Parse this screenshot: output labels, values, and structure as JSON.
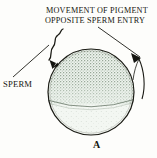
{
  "figure": {
    "panel_letter": "A",
    "title": {
      "line_1": "MOVEMENT OF PIGMENT",
      "line_2": "OPPOSITE SPERM ENTRY"
    },
    "labels": {
      "sperm": "SPERM"
    },
    "icons": {
      "sperm": "sperm-cell-icon",
      "pigment_arrow": "curved-arrow-icon",
      "egg": "egg-cell-icon"
    },
    "colors": {
      "background": "#fdfdfb",
      "egg_fill": "#eef4ee",
      "pigment_stipple": "#7d907d",
      "outline": "#1b1b15",
      "text": "#16160f"
    },
    "geometry": {
      "egg_center_x": 91,
      "egg_center_y": 92,
      "egg_radius": 43,
      "pigment_boundary_y": 104
    }
  }
}
